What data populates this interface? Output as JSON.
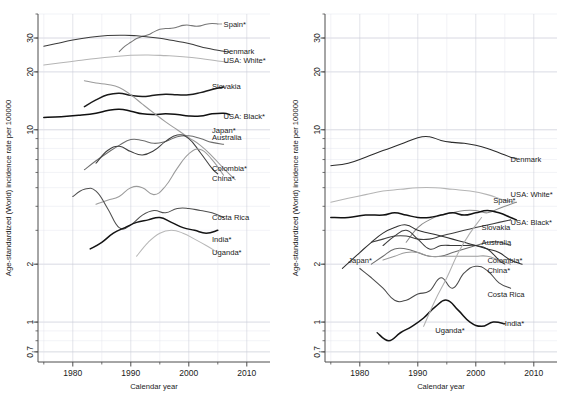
{
  "figure": {
    "panels": [
      "left",
      "right"
    ],
    "axis": {
      "xlabel": "Calendar year",
      "ylabel": "Age-standardized (World) incidence rate per 100000",
      "xticks": [
        1980,
        1990,
        2000,
        2010
      ],
      "xtick_labels": [
        "1980",
        "1990",
        "2000",
        "2010"
      ],
      "xlim": [
        1974,
        2014
      ],
      "yticks": [
        0.7,
        1,
        2,
        10,
        20,
        30
      ],
      "ytick_labels": [
        "0.7",
        "1",
        "2",
        "10",
        "20",
        "30"
      ],
      "ylim": [
        0.62,
        40
      ],
      "yscale": "log",
      "grid": true
    },
    "colors": {
      "dark": "#1b1b1b",
      "mid": "#4a4a4a",
      "gray": "#777777",
      "light": "#a8a8a8",
      "lighter": "#bdbdbd",
      "grid_major": "#c9cbd6",
      "grid_minor": "#e2e4ec",
      "axis": "#4d4d4d"
    }
  },
  "chart_data": [
    {
      "type": "line",
      "panel": "left",
      "title": "",
      "xlabel": "Calendar year",
      "ylabel": "Age-standardized (World) incidence rate per 100000",
      "yscale": "log",
      "xlim": [
        1974,
        2014
      ],
      "ylim": [
        0.62,
        40
      ],
      "yticks": [
        0.7,
        1,
        2,
        10,
        20,
        30
      ],
      "xticks": [
        1980,
        1990,
        2000,
        2010
      ],
      "grid": true,
      "legend": "inline-right-labels",
      "series": [
        {
          "name": "Spain*",
          "color": "#777777",
          "label_x": 2006,
          "label_y": 35.5,
          "x": [
            1988,
            1989,
            1990,
            1991,
            1992,
            1993,
            1994,
            1995,
            1996,
            1997,
            1998,
            1999,
            2000,
            2001,
            2002,
            2003,
            2004,
            2005
          ],
          "y": [
            25.5,
            27.2,
            28.5,
            29.8,
            30.6,
            31.2,
            32.3,
            33.3,
            33.6,
            33.7,
            34.2,
            34.9,
            35.0,
            34.6,
            34.7,
            35.4,
            35.7,
            35.5
          ]
        },
        {
          "name": "Denmark",
          "color": "#3a3a3a",
          "label_x": 2006,
          "label_y": 25.6,
          "x": [
            1975,
            1977,
            1980,
            1983,
            1986,
            1989,
            1991,
            1993,
            1995,
            1997,
            1999,
            2001,
            2003,
            2005,
            2007
          ],
          "y": [
            27.2,
            28.0,
            29.3,
            30.3,
            30.9,
            31.0,
            30.8,
            30.4,
            29.9,
            29.2,
            28.5,
            27.6,
            26.6,
            25.9,
            25.3
          ]
        },
        {
          "name": "USA: White*",
          "color": "#b5b5b5",
          "label_x": 2006,
          "label_y": 23.0,
          "x": [
            1975,
            1978,
            1981,
            1984,
            1987,
            1990,
            1993,
            1996,
            1999,
            2002,
            2005,
            2007
          ],
          "y": [
            21.7,
            22.3,
            22.9,
            23.5,
            24.0,
            24.4,
            24.5,
            24.3,
            24.0,
            23.5,
            22.8,
            22.4
          ]
        },
        {
          "name": "Slovakia",
          "color": "#1b1b1b",
          "label_x": 2004,
          "label_y": 16.8,
          "x": [
            1982,
            1984,
            1986,
            1988,
            1990,
            1992,
            1994,
            1996,
            1998,
            2000,
            2002,
            2004,
            2006
          ],
          "y": [
            13.2,
            14.3,
            15.2,
            15.5,
            15.1,
            14.9,
            15.1,
            15.3,
            15.2,
            15.2,
            15.6,
            16.2,
            16.7
          ]
        },
        {
          "name": "USA: Black*",
          "color": "#111111",
          "label_x": 2006,
          "label_y": 11.8,
          "x": [
            1975,
            1978,
            1981,
            1984,
            1986,
            1988,
            1990,
            1992,
            1994,
            1996,
            1998,
            2000,
            2002,
            2004,
            2006,
            2007
          ],
          "y": [
            11.6,
            11.7,
            11.9,
            12.2,
            12.6,
            12.8,
            12.5,
            12.1,
            12.0,
            12.1,
            12.0,
            11.8,
            11.8,
            12.1,
            12.2,
            12.0
          ]
        },
        {
          "name": "Japan*",
          "color": "#9b9b9b",
          "label_x": 2004,
          "label_y": 9.9,
          "x": [
            1982,
            1984,
            1986,
            1988,
            1990,
            1992,
            1994,
            1996,
            1998,
            2000,
            2002,
            2004,
            2006,
            2008
          ],
          "y": [
            18.0,
            17.5,
            17.2,
            16.6,
            15.2,
            13.6,
            12.2,
            11.0,
            10.0,
            9.1,
            8.3,
            7.3,
            6.3,
            5.5
          ]
        },
        {
          "name": "Australia",
          "color": "#6d6d6d",
          "label_x": 2004,
          "label_y": 9.1,
          "x": [
            1982,
            1984,
            1986,
            1988,
            1990,
            1992,
            1994,
            1996,
            1998,
            2000,
            2002,
            2004,
            2006
          ],
          "y": [
            6.2,
            6.9,
            7.6,
            8.3,
            8.9,
            8.8,
            8.5,
            8.7,
            9.2,
            9.3,
            9.0,
            8.6,
            8.4
          ]
        },
        {
          "name": "Colombia*",
          "color": "#3f3f3f",
          "label_x": 2004,
          "label_y": 6.3,
          "x": [
            1984,
            1986,
            1988,
            1990,
            1992,
            1994,
            1996,
            1998,
            2000,
            2002,
            2004,
            2005
          ],
          "y": [
            6.7,
            7.8,
            8.2,
            7.7,
            7.4,
            7.8,
            8.7,
            9.4,
            9.0,
            7.6,
            6.3,
            5.9
          ]
        },
        {
          "name": "China*",
          "color": "#9b9b9b",
          "label_x": 2004,
          "label_y": 5.6,
          "x": [
            1984,
            1986,
            1988,
            1990,
            1992,
            1994,
            1996,
            1998,
            2000,
            2002,
            2004,
            2006
          ],
          "y": [
            4.1,
            4.3,
            4.5,
            5.0,
            5.0,
            4.6,
            5.1,
            6.3,
            7.5,
            7.9,
            7.0,
            5.8
          ]
        },
        {
          "name": "Costa Rica",
          "color": "#4f4f4f",
          "label_x": 2004,
          "label_y": 3.5,
          "x": [
            1980,
            1982,
            1984,
            1986,
            1988,
            1990,
            1992,
            1994,
            1996,
            1998,
            2000,
            2002,
            2004,
            2006
          ],
          "y": [
            4.5,
            4.9,
            4.8,
            3.9,
            3.1,
            3.2,
            3.6,
            3.8,
            3.7,
            3.9,
            3.9,
            3.8,
            3.7,
            3.5
          ]
        },
        {
          "name": "India*",
          "color": "#141414",
          "label_x": 2004,
          "label_y": 2.7,
          "x": [
            1983,
            1985,
            1987,
            1989,
            1991,
            1993,
            1995,
            1997,
            1999,
            2001,
            2003,
            2005
          ],
          "y": [
            2.4,
            2.6,
            2.9,
            3.1,
            3.3,
            3.4,
            3.5,
            3.3,
            3.1,
            3.0,
            2.9,
            3.0
          ]
        },
        {
          "name": "Uganda*",
          "color": "#b8b8b8",
          "label_x": 2004,
          "label_y": 2.3,
          "x": [
            1991,
            1993,
            1995,
            1997,
            1999,
            2001,
            2003,
            2005
          ],
          "y": [
            2.2,
            2.6,
            2.9,
            3.0,
            2.9,
            2.7,
            2.5,
            2.3
          ]
        }
      ]
    },
    {
      "type": "line",
      "panel": "right",
      "title": "",
      "xlabel": "Calendar year",
      "ylabel": "Age-standardized (World) incidence rate per 100000",
      "yscale": "log",
      "xlim": [
        1974,
        2014
      ],
      "ylim": [
        0.62,
        40
      ],
      "yticks": [
        0.7,
        1,
        2,
        10,
        20,
        30
      ],
      "xticks": [
        1980,
        1990,
        2000,
        2010
      ],
      "grid": true,
      "legend": "inline-right-labels",
      "series": [
        {
          "name": "Denmark",
          "color": "#2b2b2b",
          "label_x": 2006,
          "label_y": 7.0,
          "x": [
            1975,
            1978,
            1981,
            1984,
            1987,
            1990,
            1992,
            1994,
            1996,
            1998,
            2000,
            2002,
            2004,
            2006,
            2007
          ],
          "y": [
            6.5,
            6.7,
            7.2,
            7.8,
            8.4,
            9.1,
            9.2,
            8.8,
            8.6,
            8.5,
            8.3,
            8.0,
            7.6,
            7.2,
            7.1
          ]
        },
        {
          "name": "USA: White*",
          "color": "#b5b5b5",
          "label_x": 2006,
          "label_y": 4.6,
          "x": [
            1975,
            1978,
            1981,
            1984,
            1987,
            1990,
            1993,
            1996,
            1999,
            2002,
            2005,
            2007
          ],
          "y": [
            4.2,
            4.4,
            4.6,
            4.8,
            4.9,
            5.0,
            5.0,
            4.9,
            4.8,
            4.6,
            4.3,
            4.2
          ]
        },
        {
          "name": "Spain*",
          "color": "#8a8a8a",
          "label_x": 2003,
          "label_y": 4.3,
          "x": [
            1988,
            1990,
            1992,
            1994,
            1996,
            1998,
            2000,
            2002,
            2004,
            2006,
            2007
          ],
          "y": [
            2.6,
            3.1,
            3.4,
            3.6,
            3.7,
            3.8,
            3.8,
            3.7,
            3.9,
            4.1,
            4.2
          ]
        },
        {
          "name": "USA: Black*",
          "color": "#111111",
          "label_x": 2006,
          "label_y": 3.3,
          "x": [
            1975,
            1978,
            1981,
            1984,
            1986,
            1988,
            1990,
            1992,
            1994,
            1996,
            1998,
            2000,
            2002,
            2004,
            2006,
            2007
          ],
          "y": [
            3.5,
            3.5,
            3.6,
            3.6,
            3.7,
            3.6,
            3.5,
            3.5,
            3.6,
            3.7,
            3.6,
            3.7,
            3.8,
            3.7,
            3.5,
            3.4
          ]
        },
        {
          "name": "Slovakia",
          "color": "#3f3f3f",
          "label_x": 2001,
          "label_y": 3.1,
          "x": [
            1982,
            1984,
            1986,
            1988,
            1990,
            1992,
            1994,
            1996,
            1998,
            2000,
            2002,
            2004,
            2006
          ],
          "y": [
            2.6,
            2.7,
            2.8,
            2.8,
            2.7,
            2.7,
            2.8,
            2.9,
            3.0,
            3.1,
            3.2,
            3.3,
            3.4
          ]
        },
        {
          "name": "Australia",
          "color": "#6d6d6d",
          "label_x": 2001,
          "label_y": 2.6,
          "x": [
            1982,
            1984,
            1986,
            1988,
            1990,
            1992,
            1994,
            1996,
            1998,
            2000,
            2002,
            2004,
            2006
          ],
          "y": [
            2.0,
            2.2,
            2.4,
            2.4,
            2.3,
            2.2,
            2.2,
            2.3,
            2.4,
            2.5,
            2.6,
            2.6,
            2.5
          ]
        },
        {
          "name": "Colombia*",
          "color": "#3a3a3a",
          "label_x": 2002,
          "label_y": 2.1,
          "x": [
            1984,
            1986,
            1988,
            1990,
            1992,
            1994,
            1996,
            1998,
            2000,
            2002,
            2004,
            2005
          ],
          "y": [
            2.5,
            2.8,
            3.0,
            2.7,
            2.4,
            2.5,
            2.5,
            2.5,
            2.5,
            2.4,
            2.1,
            2.0
          ]
        },
        {
          "name": "China*",
          "color": "#9b9b9b",
          "label_x": 2002,
          "label_y": 1.85,
          "x": [
            1984,
            1986,
            1988,
            1990,
            1992,
            1994,
            1996,
            1998,
            2000,
            2002,
            2004,
            2006
          ],
          "y": [
            2.1,
            2.2,
            2.3,
            2.3,
            2.2,
            2.2,
            2.2,
            2.2,
            2.2,
            2.2,
            2.1,
            2.0
          ]
        },
        {
          "name": "Costa Rica",
          "color": "#4a4a4a",
          "label_x": 2002,
          "label_y": 1.4,
          "x": [
            1980,
            1982,
            1984,
            1986,
            1988,
            1990,
            1992,
            1994,
            1996,
            1998,
            2000,
            2002,
            2004,
            2006
          ],
          "y": [
            1.9,
            1.7,
            1.5,
            1.3,
            1.3,
            1.4,
            1.45,
            1.7,
            1.5,
            1.8,
            1.95,
            1.85,
            1.6,
            1.5
          ]
        },
        {
          "name": "Japan*",
          "color": "#2f2f2f",
          "label_x": 1978,
          "label_y": 2.1,
          "x": [
            1977,
            1980,
            1982,
            1984,
            1986,
            1988,
            1990,
            1992,
            1994,
            1996,
            1998,
            2000,
            2002,
            2004,
            2006,
            2008
          ],
          "y": [
            1.9,
            2.3,
            2.6,
            2.9,
            3.1,
            3.2,
            3.0,
            2.9,
            2.8,
            2.7,
            2.6,
            2.5,
            2.4,
            2.3,
            2.1,
            2.0
          ]
        },
        {
          "name": "India*",
          "color": "#141414",
          "label_x": 2005,
          "label_y": 0.98,
          "x": [
            1983,
            1985,
            1987,
            1989,
            1991,
            1993,
            1995,
            1997,
            1999,
            2001,
            2003,
            2005
          ],
          "y": [
            0.88,
            0.8,
            0.88,
            0.95,
            1.05,
            1.2,
            1.3,
            1.15,
            1.0,
            0.95,
            1.0,
            0.98
          ]
        },
        {
          "name": "Uganda*",
          "color": "#b0b0b0",
          "label_x": 1993,
          "label_y": 0.9,
          "x": [
            1991,
            1993,
            1995,
            1997,
            1999,
            2001
          ],
          "y": [
            0.95,
            1.3,
            1.7,
            2.3,
            2.9,
            3.5
          ]
        }
      ]
    }
  ]
}
